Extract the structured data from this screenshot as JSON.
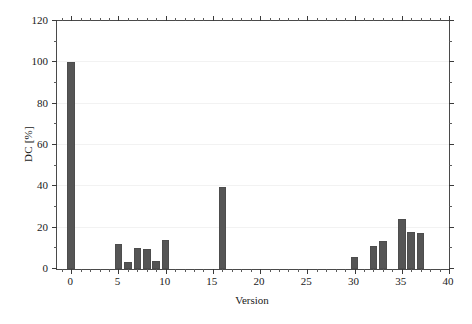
{
  "chart_data": {
    "type": "bar",
    "title": "",
    "xlabel": "Version",
    "ylabel": "DC [%]",
    "xlim": [
      -1.5,
      40
    ],
    "ylim": [
      0,
      120
    ],
    "xticks": [
      0,
      5,
      10,
      15,
      20,
      25,
      30,
      35,
      40
    ],
    "xtick_labels": [
      "0",
      "5",
      "10",
      "15",
      "20",
      "25",
      "30",
      "35",
      "40"
    ],
    "yticks": [
      0,
      20,
      40,
      60,
      80,
      100,
      120
    ],
    "ytick_labels": [
      "0",
      "20",
      "40",
      "60",
      "80",
      "100",
      "120"
    ],
    "x_minor_tick_step": 1,
    "y_minor_tick_step": 10,
    "grid": true,
    "grid_axis": "y",
    "grid_color": "#f2f2f2",
    "bar_color": "#555555",
    "bar_edge_color": "#4d4d4d",
    "bar_width": 0.8,
    "legend": null,
    "x": [
      0,
      5,
      6,
      7,
      8,
      9,
      10,
      16,
      30,
      32,
      33,
      35,
      36,
      37
    ],
    "values": [
      100,
      12,
      3.5,
      10,
      9.5,
      4,
      14,
      39.5,
      6,
      11,
      13.5,
      24,
      18,
      17.5
    ],
    "points": [
      {
        "version": 0,
        "dc": 100
      },
      {
        "version": 5,
        "dc": 12
      },
      {
        "version": 6,
        "dc": 3.5
      },
      {
        "version": 7,
        "dc": 10
      },
      {
        "version": 8,
        "dc": 9.5
      },
      {
        "version": 9,
        "dc": 4
      },
      {
        "version": 10,
        "dc": 14
      },
      {
        "version": 16,
        "dc": 39.5
      },
      {
        "version": 30,
        "dc": 6
      },
      {
        "version": 32,
        "dc": 11
      },
      {
        "version": 33,
        "dc": 13.5
      },
      {
        "version": 35,
        "dc": 24
      },
      {
        "version": 36,
        "dc": 18
      },
      {
        "version": 37,
        "dc": 17.5
      }
    ]
  }
}
